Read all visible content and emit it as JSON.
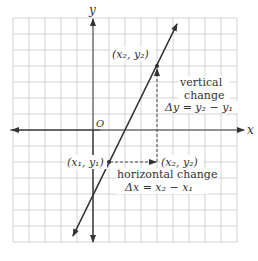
{
  "diagram": {
    "axes": {
      "x_label": "x",
      "y_label": "y",
      "origin_label": "O"
    },
    "points": {
      "p1_label": "(x₁, y₁)",
      "p2_label": "(x₂, y₂)",
      "corner_label": "(x₂, y₂)"
    },
    "annotations": {
      "vertical_line1": "vertical",
      "vertical_line2": "change",
      "vertical_formula": "Δy = y₂ − y₁",
      "horizontal_line1": "horizontal change",
      "horizontal_formula": "Δx = x₂ − x₁"
    },
    "colors": {
      "grid": "#c8c8c8",
      "line": "#2e2e2e",
      "text": "#333333"
    }
  }
}
